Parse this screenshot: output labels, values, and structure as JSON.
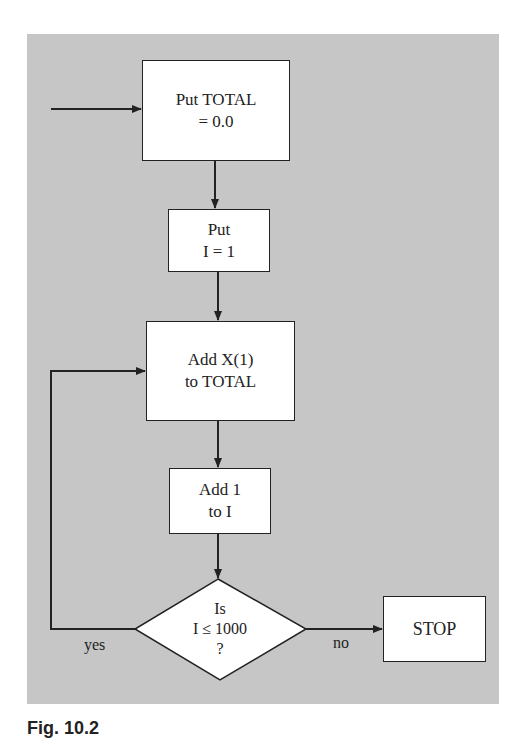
{
  "diagram": {
    "type": "flowchart",
    "background_color": "#c6c6c6",
    "nodes": [
      {
        "id": "init_total",
        "shape": "rectangle",
        "lines": [
          "Put TOTAL",
          "= 0.0"
        ]
      },
      {
        "id": "init_i",
        "shape": "rectangle",
        "lines": [
          "Put",
          "I = 1"
        ]
      },
      {
        "id": "add_x",
        "shape": "rectangle",
        "lines": [
          "Add X(1)",
          "to TOTAL"
        ]
      },
      {
        "id": "inc_i",
        "shape": "rectangle",
        "lines": [
          "Add 1",
          "to I"
        ]
      },
      {
        "id": "decision",
        "shape": "diamond",
        "lines": [
          "Is",
          "I ≤ 1000",
          "?"
        ]
      },
      {
        "id": "stop",
        "shape": "rectangle",
        "lines": [
          "STOP"
        ]
      }
    ],
    "edges": [
      {
        "from": "start",
        "to": "init_total",
        "label": ""
      },
      {
        "from": "init_total",
        "to": "init_i",
        "label": ""
      },
      {
        "from": "init_i",
        "to": "add_x",
        "label": ""
      },
      {
        "from": "add_x",
        "to": "inc_i",
        "label": ""
      },
      {
        "from": "inc_i",
        "to": "decision",
        "label": ""
      },
      {
        "from": "decision",
        "to": "add_x",
        "label": "yes"
      },
      {
        "from": "decision",
        "to": "stop",
        "label": "no"
      }
    ],
    "edge_labels": {
      "yes": "yes",
      "no": "no"
    }
  },
  "caption": "Fig. 10.2"
}
